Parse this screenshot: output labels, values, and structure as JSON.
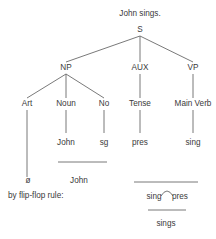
{
  "diagram": {
    "type": "phrase-structure-tree",
    "title": "John sings.",
    "nodes": {
      "s": "S",
      "np": "NP",
      "aux": "AUX",
      "vp": "VP",
      "art": "Art",
      "noun": "Noun",
      "no": "No",
      "tense": "Tense",
      "main_verb": "Main Verb",
      "john_leaf": "John",
      "sg_leaf": "sg",
      "pres_leaf": "pres",
      "sing_leaf": "sing",
      "null_art": "ø"
    },
    "derivation": {
      "np_result": "John",
      "flip_flop_label": "by flip-flop rule:",
      "flip_left": "sing",
      "flip_right": "pres",
      "final_result": "sings"
    },
    "edges": [
      [
        "S",
        "NP"
      ],
      [
        "S",
        "AUX"
      ],
      [
        "S",
        "VP"
      ],
      [
        "NP",
        "Art"
      ],
      [
        "NP",
        "Noun"
      ],
      [
        "NP",
        "No"
      ],
      [
        "AUX",
        "Tense"
      ],
      [
        "VP",
        "Main Verb"
      ],
      [
        "Art",
        "ø"
      ],
      [
        "Noun",
        "John"
      ],
      [
        "No",
        "sg"
      ],
      [
        "Tense",
        "pres"
      ],
      [
        "Main Verb",
        "sing"
      ]
    ]
  }
}
